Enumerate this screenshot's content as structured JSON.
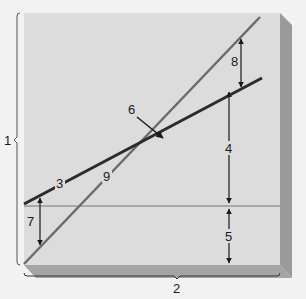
{
  "diagram": {
    "type": "labeled line-graph diagram",
    "axis_labels": {
      "vertical": "1",
      "horizontal": "2"
    },
    "lines": [
      {
        "id": "line-3",
        "label": "3",
        "color": "#2b2b2b",
        "description": "shallow dark line"
      },
      {
        "id": "line-9",
        "label": "9",
        "color": "#6b6b6b",
        "description": "steep gray line"
      },
      {
        "id": "baseline",
        "label": "",
        "color": "#a9a9a9",
        "description": "horizontal gray line"
      }
    ],
    "annotations": {
      "intersection": "6",
      "gap_top_right": "8",
      "gap_middle": "4",
      "gap_bottom": "5",
      "gap_left": "7"
    },
    "colors": {
      "background": "#f2f2f2",
      "panel": "#dcdcdc",
      "panel_shadow": "#9a9a9a",
      "ink": "#1a1a1a"
    }
  }
}
